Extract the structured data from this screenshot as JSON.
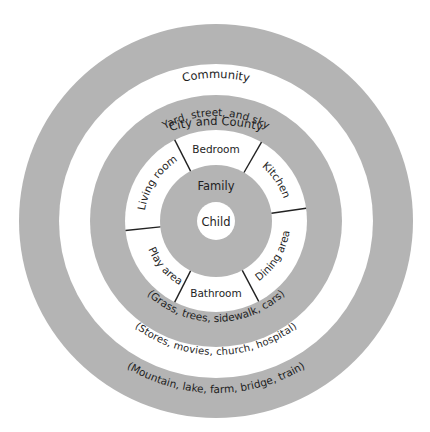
{
  "diagram": {
    "type": "concentric-circles",
    "colors": {
      "gray_ring": "#b4b4b4",
      "white_ring": "#ffffff",
      "text": "#1e1e1e",
      "divider": "#222222"
    },
    "rings": [
      {
        "id": "city",
        "label": "City and County",
        "examples": "(Mountain, lake, farm, bridge, train)",
        "fill": "gray"
      },
      {
        "id": "community",
        "label": "Community",
        "examples": "(Stores, movies, church, hospital)",
        "fill": "white"
      },
      {
        "id": "neighborhood",
        "label": "Yard, street, and sky",
        "examples": "(Grass, trees, sidewalk, cars)",
        "fill": "gray"
      },
      {
        "id": "home",
        "label": "",
        "fill": "white",
        "rooms": [
          {
            "label": "Bedroom"
          },
          {
            "label": "Kitchen"
          },
          {
            "label": "Dining area"
          },
          {
            "label": "Bathroom"
          },
          {
            "label": "Play area"
          },
          {
            "label": "Living room"
          }
        ]
      },
      {
        "id": "family",
        "label": "Family",
        "fill": "gray"
      },
      {
        "id": "child",
        "label": "Child",
        "fill": "white"
      }
    ]
  }
}
